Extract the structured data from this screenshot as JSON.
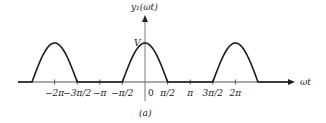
{
  "figure": {
    "caption": "(a)",
    "y_axis_label": "y₁(ωt)",
    "x_axis_label": "ωt",
    "peak_label": "V",
    "origin_label": "0",
    "colors": {
      "curve": "#1a1a1a",
      "axis": "#555555",
      "text": "#222222"
    }
  },
  "axis": {
    "origin_px": {
      "x": 145,
      "y": 82
    },
    "px_per_half_pi": 22.6,
    "peak_px": 39,
    "ticks": [
      {
        "value": -6.2832,
        "label": "−2π"
      },
      {
        "value": -4.7124,
        "label": "−3π/2"
      },
      {
        "value": -3.1416,
        "label": "−π"
      },
      {
        "value": -1.5708,
        "label": "−π/2"
      },
      {
        "value": 1.5708,
        "label": "π/2"
      },
      {
        "value": 3.1416,
        "label": "π"
      },
      {
        "value": 4.7124,
        "label": "3π/2"
      },
      {
        "value": 6.2832,
        "label": "2π"
      }
    ]
  },
  "chart_data": {
    "type": "line",
    "title": "",
    "xlabel": "ωt",
    "ylabel": "y₁(ωt)",
    "xlim": [
      -7.9,
      7.9
    ],
    "ylim": [
      0,
      1
    ],
    "humps": [
      {
        "center": -6.2832,
        "from": -7.854,
        "to": -4.7124,
        "peak": "V"
      },
      {
        "center": 0,
        "from": -1.5708,
        "to": 1.5708,
        "peak": "V"
      },
      {
        "center": 6.2832,
        "from": 4.7124,
        "to": 7.854,
        "peak": "V"
      }
    ],
    "x_tick_labels": [
      "−2π",
      "−3π/2",
      "−π",
      "−π/2",
      "0",
      "π/2",
      "π",
      "3π/2",
      "2π"
    ],
    "y_tick_labels": [
      "V"
    ],
    "grid": false,
    "legend": null
  }
}
